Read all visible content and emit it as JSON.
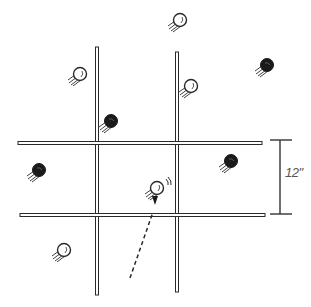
{
  "diagram": {
    "background": "#ffffff",
    "ink_color": "#2a2a2a",
    "grid_lines": {
      "vertical": [
        {
          "x": 97,
          "y1": 47,
          "y2": 295
        },
        {
          "x": 177,
          "y1": 52,
          "y2": 292
        }
      ],
      "horizontal": [
        {
          "y": 143,
          "x1": 18,
          "x2": 262
        },
        {
          "y": 215,
          "x1": 20,
          "x2": 265
        }
      ]
    },
    "dimension": {
      "label": "12\"",
      "x": 280,
      "y_top": 140,
      "y_bottom": 214,
      "cap_x1": 270,
      "cap_x2": 292
    },
    "balls": [
      {
        "id": "ball-top",
        "x": 180,
        "y": 20,
        "color": "white"
      },
      {
        "id": "ball-upper-left",
        "x": 80,
        "y": 74,
        "color": "white"
      },
      {
        "id": "ball-near-line1",
        "x": 111,
        "y": 121,
        "color": "black"
      },
      {
        "id": "ball-near-line2",
        "x": 191,
        "y": 86,
        "color": "white"
      },
      {
        "id": "ball-upper-right",
        "x": 267,
        "y": 65,
        "color": "black"
      },
      {
        "id": "ball-left-middle",
        "x": 39,
        "y": 170,
        "color": "black"
      },
      {
        "id": "ball-right-middle",
        "x": 231,
        "y": 161,
        "color": "black"
      },
      {
        "id": "ball-center-target",
        "x": 157,
        "y": 188,
        "color": "white",
        "highlighted": true
      },
      {
        "id": "ball-lower-left",
        "x": 64,
        "y": 250,
        "color": "white"
      }
    ],
    "trajectory": {
      "style": "dashed",
      "x1": 130,
      "y1": 278,
      "x2": 153,
      "y2": 212
    }
  }
}
